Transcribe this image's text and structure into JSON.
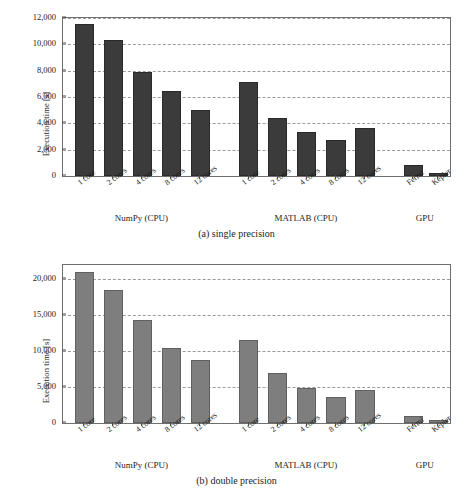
{
  "figure": {
    "panels": [
      {
        "id": "panel-a",
        "caption": "(a) single precision",
        "ylabel": "Execution time [s]",
        "bar_color": "#3b3b3b"
      },
      {
        "id": "panel-b",
        "caption": "(b) double precision",
        "ylabel": "Execution time [s]",
        "bar_color": "#7e7e7e"
      }
    ]
  },
  "chart_data": [
    {
      "type": "bar",
      "title": "(a) single precision",
      "xlabel": "",
      "ylabel": "Execution time [s]",
      "ylim": [
        0,
        12000
      ],
      "yticks": [
        0,
        2000,
        4000,
        6000,
        8000,
        10000,
        12000
      ],
      "ytick_labels": [
        "0",
        "2,000",
        "4,000",
        "6,000",
        "8,000",
        "10,000",
        "12,000"
      ],
      "grid": true,
      "legend": "none",
      "groups": [
        {
          "name": "NumPy (CPU)",
          "categories": [
            "1 core",
            "2 cores",
            "4 cores",
            "8 cores",
            "12 cores"
          ],
          "values": [
            11550,
            10320,
            7900,
            6450,
            4980
          ]
        },
        {
          "name": "MATLAB (CPU)",
          "categories": [
            "1 core",
            "2 cores",
            "4 cores",
            "8 cores",
            "12 cores"
          ],
          "values": [
            7150,
            4400,
            3350,
            2700,
            3650
          ]
        },
        {
          "name": "GPU",
          "categories": [
            "Fermi",
            "Kepler"
          ],
          "values": [
            800,
            250
          ]
        }
      ]
    },
    {
      "type": "bar",
      "title": "(b) double precision",
      "xlabel": "",
      "ylabel": "Execution time [s]",
      "ylim": [
        0,
        22000
      ],
      "yticks": [
        0,
        5000,
        10000,
        15000,
        20000
      ],
      "ytick_labels": [
        "0",
        "5,000",
        "10,000",
        "15,000",
        "20,000"
      ],
      "grid": true,
      "legend": "none",
      "groups": [
        {
          "name": "NumPy (CPU)",
          "categories": [
            "1 core",
            "2 cores",
            "4 cores",
            "8 cores",
            "12 cores"
          ],
          "values": [
            21000,
            18500,
            14400,
            10400,
            8800
          ]
        },
        {
          "name": "MATLAB (CPU)",
          "categories": [
            "1 core",
            "2 cores",
            "4 cores",
            "8 cores",
            "12 cores"
          ],
          "values": [
            11600,
            6900,
            4900,
            3650,
            4600
          ]
        },
        {
          "name": "GPU",
          "categories": [
            "Fermi",
            "Kepler"
          ],
          "values": [
            1000,
            400
          ]
        }
      ]
    }
  ]
}
